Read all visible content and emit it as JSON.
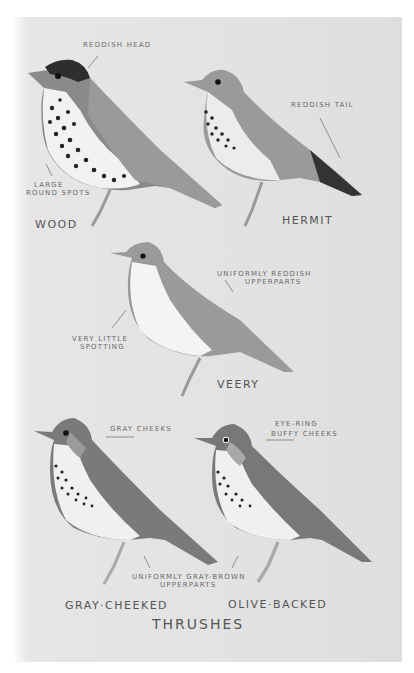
{
  "plate": {
    "title": "Thrushes",
    "background_color": "#e2e2e2"
  },
  "birds": [
    {
      "name": "Wood",
      "annotations": [
        "Reddish head",
        "Large round spots"
      ]
    },
    {
      "name": "Hermit",
      "annotations": [
        "Reddish tail"
      ]
    },
    {
      "name": "Veery",
      "annotations": [
        "Uniformly reddish upperparts",
        "Very little spotting"
      ]
    },
    {
      "name": "Gray-cheeked",
      "annotations": [
        "Gray cheeks"
      ]
    },
    {
      "name": "Olive-backed",
      "annotations": [
        "Eye-ring buffy cheeks"
      ]
    }
  ],
  "shared_annotations": [
    "Uniformly gray-brown upperparts"
  ],
  "labels": {
    "wood_head": "Reddish head",
    "wood_spots_1": "Large",
    "wood_spots_2": "round spots",
    "hermit_tail": "Reddish tail",
    "veery_upper_1": "Uniformly reddish",
    "veery_upper_2": "upperparts",
    "veery_spot_1": "Very little",
    "veery_spot_2": "spotting",
    "gray_cheeks": "Gray cheeks",
    "olive_1": "Eye-ring",
    "olive_2": "Buffy cheeks",
    "shared_1": "Uniformly gray-brown",
    "shared_2": "upperparts",
    "name_wood": "Wood",
    "name_hermit": "Hermit",
    "name_veery": "Veery",
    "name_gray": "Gray·Cheeked",
    "name_olive": "Olive·Backed"
  }
}
